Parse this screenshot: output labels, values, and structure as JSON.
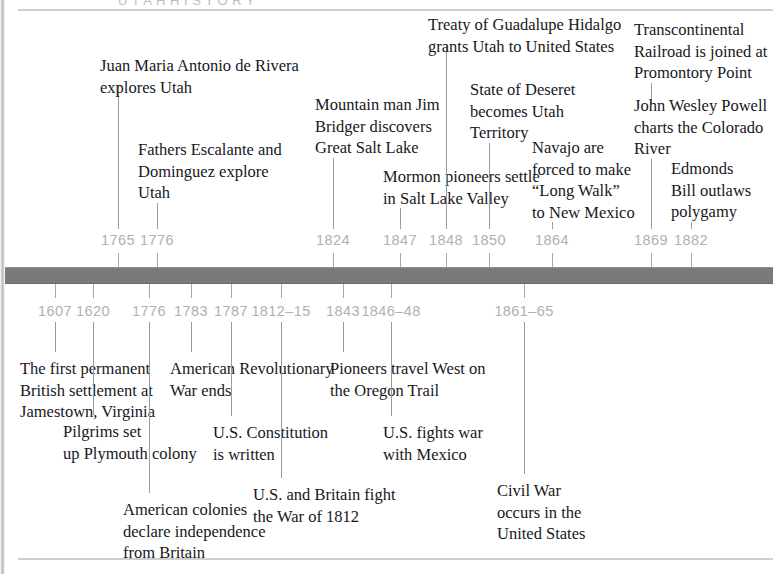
{
  "page": {
    "title_sliver": "U T A H   H I S T O R Y",
    "bar_color": "#7a7a7a",
    "year_color": "#b0b0b0",
    "text_color": "#16181c",
    "rule_color": "#cfcfcf"
  },
  "timeline": {
    "orientation": "horizontal",
    "upper_track_label": "Utah events",
    "lower_track_label": "United States events",
    "upper_events": [
      {
        "year": "1765",
        "text": "Juan Maria Antonio de Rivera\nexplores Utah",
        "year_x": 118,
        "label_x": 100,
        "label_y": 55,
        "leader_top": 85,
        "leader_height": 144
      },
      {
        "year": "1776",
        "text": "Fathers Escalante and\nDominguez explore\nUtah",
        "year_x": 157,
        "label_x": 138,
        "label_y": 139,
        "leader_top": 203,
        "leader_height": 26
      },
      {
        "year": "1824",
        "text": "Mountain man Jim\nBridger discovers\nGreat Salt Lake",
        "year_x": 333,
        "label_x": 315,
        "label_y": 94,
        "leader_top": 158,
        "leader_height": 71
      },
      {
        "year": "1847",
        "text": "Mormon pioneers settle\nin Salt Lake Valley",
        "year_x": 400,
        "label_x": 383,
        "label_y": 166,
        "leader_top": 208,
        "leader_height": 21
      },
      {
        "year": "1848",
        "text": "Treaty of Guadalupe Hidalgo\ngrants Utah to United States",
        "year_x": 446,
        "label_x": 428,
        "label_y": 14,
        "leader_top": 44,
        "leader_height": 185
      },
      {
        "year": "1850",
        "text": "State of Deseret\nbecomes Utah\nTerritory",
        "year_x": 489,
        "label_x": 470,
        "label_y": 79,
        "leader_top": 143,
        "leader_height": 86
      },
      {
        "year": "1864",
        "text": "Navajo are\nforced to make\n“Long Walk”\nto New Mexico",
        "year_x": 552,
        "label_x": 532,
        "label_y": 137,
        "leader_top": 222,
        "leader_height": 7
      },
      {
        "year": "1869",
        "text": "Transcontinental\nRailroad is joined at\nPromontory Point",
        "year_x": 651,
        "label_x": 634,
        "label_y": 19,
        "leader_top": 83,
        "leader_height": 22
      },
      {
        "year": "1869",
        "text": "John Wesley Powell\ncharts the Colorado\nRiver",
        "year_x": 651,
        "label_x": 634,
        "label_y": 95,
        "leader_top": 159,
        "leader_height": 70,
        "secondary": true
      },
      {
        "year": "1882",
        "text": "Edmonds\nBill outlaws\npolygamy",
        "year_x": 691,
        "label_x": 671,
        "label_y": 158,
        "leader_top": 222,
        "leader_height": 7
      }
    ],
    "lower_events": [
      {
        "year": "1607",
        "text": "The first permanent\nBritish settlement at\nJamestown, Virginia",
        "year_x": 55,
        "label_x": 20,
        "label_y": 358,
        "leader_top": 322,
        "leader_height": 30
      },
      {
        "year": "1620",
        "text": "Pilgrims set\nup Plymouth colony",
        "year_x": 93,
        "label_x": 63,
        "label_y": 421,
        "leader_top": 322,
        "leader_height": 93
      },
      {
        "year": "1776",
        "text": "American colonies\ndeclare independence\nfrom Britain",
        "year_x": 149,
        "label_x": 123,
        "label_y": 499,
        "leader_top": 322,
        "leader_height": 171
      },
      {
        "year": "1783",
        "text": "American Revolutionary\nWar ends",
        "year_x": 191,
        "label_x": 170,
        "label_y": 358,
        "leader_top": 322,
        "leader_height": 30
      },
      {
        "year": "1787",
        "text": "U.S. Constitution\nis written",
        "year_x": 231,
        "label_x": 213,
        "label_y": 422,
        "leader_top": 322,
        "leader_height": 94
      },
      {
        "year": "1812–15",
        "text": "U.S. and Britain fight\nthe War of 1812",
        "year_x": 281,
        "label_x": 253,
        "label_y": 484,
        "leader_top": 322,
        "leader_height": 156
      },
      {
        "year": "1843",
        "text": "Pioneers travel West on\nthe Oregon Trail",
        "year_x": 343,
        "label_x": 330,
        "label_y": 358,
        "leader_top": 322,
        "leader_height": 30
      },
      {
        "year": "1846–48",
        "text": "U.S. fights war\nwith Mexico",
        "year_x": 391,
        "label_x": 383,
        "label_y": 422,
        "leader_top": 322,
        "leader_height": 94
      },
      {
        "year": "1861–65",
        "text": "Civil War\noccurs in the\nUnited States",
        "year_x": 524,
        "label_x": 497,
        "label_y": 480,
        "leader_top": 322,
        "leader_height": 152
      }
    ],
    "bar_ticks_upper_x": [
      118,
      157,
      333,
      400,
      446,
      489,
      552,
      651,
      691
    ],
    "bar_ticks_lower_x": [
      55,
      93,
      149,
      191,
      231,
      281,
      343,
      391,
      524
    ]
  }
}
